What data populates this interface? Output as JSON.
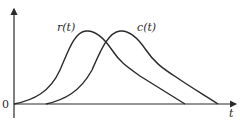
{
  "diagram": {
    "type": "signal-response-plot",
    "axes": {
      "x_label": "t",
      "origin_label": "0"
    },
    "curves": [
      {
        "name": "r(t)",
        "label": "r(t)",
        "description": "input curve, starts at origin, bell-shaped rise then linear-like decay"
      },
      {
        "name": "c(t)",
        "label": "c(t)",
        "description": "output curve, delayed copy of r(t), starts later and ends later"
      }
    ],
    "colors": {
      "stroke": "#2a2a2a",
      "background": "#ffffff"
    }
  }
}
